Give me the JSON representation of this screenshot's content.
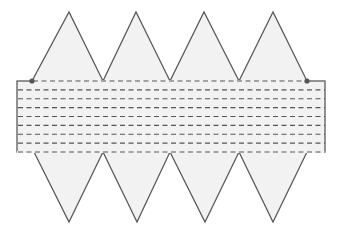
{
  "diagram": {
    "colors": {
      "stroke": "#5a5a5a",
      "fill": "#f2f2f2",
      "dash": "#555555",
      "dot": "#555555",
      "background": "#ffffff"
    },
    "rectangle": {
      "x1": 17,
      "y1": 81,
      "x2": 325,
      "y2": 152
    },
    "top_peaks_x": [
      69,
      136,
      204,
      273
    ],
    "top_peak_y": 12,
    "top_base_points_x": [
      32,
      103,
      170,
      239,
      307
    ],
    "bottom_tips_x": [
      69,
      137,
      205,
      273
    ],
    "bottom_tip_y": 222,
    "bottom_base_points_x": [
      34,
      103,
      170,
      239,
      307
    ],
    "dashed_rows": 9,
    "dots": [
      {
        "x": 32,
        "y": 81
      },
      {
        "x": 307,
        "y": 81
      }
    ]
  }
}
